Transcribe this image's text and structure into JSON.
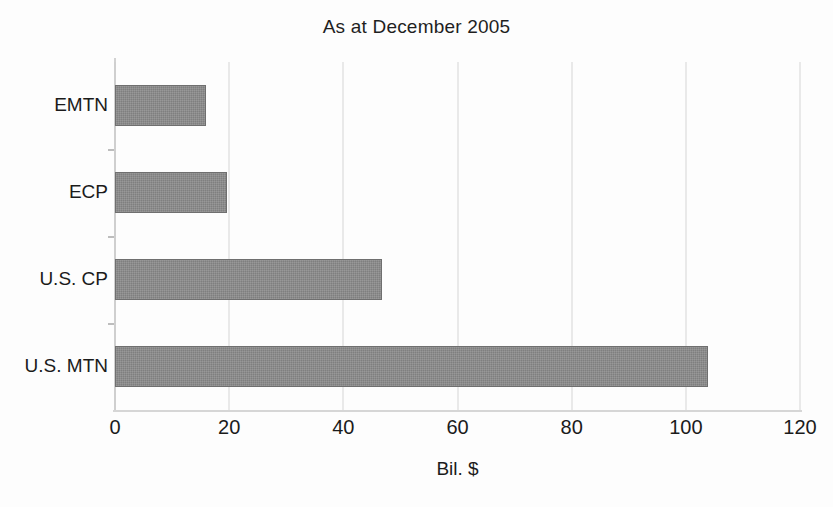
{
  "chart_data": {
    "type": "bar",
    "orientation": "horizontal",
    "title": "As at December 2005",
    "xlabel": "Bil. $",
    "ylabel": "",
    "categories": [
      "EMTN",
      "ECP",
      "U.S. CP",
      "U.S. MTN"
    ],
    "values": [
      16,
      19.7,
      46.8,
      103.8
    ],
    "xlim": [
      0,
      120
    ],
    "xticks": [
      0,
      20,
      40,
      60,
      80,
      100,
      120
    ],
    "xtick_labels": [
      "0",
      "20",
      "40",
      "60",
      "80",
      "100",
      "120"
    ],
    "grid": "vertical",
    "legend": null,
    "series": [
      {
        "name": "Outstanding",
        "values": [
          16,
          19.7,
          46.8,
          103.8
        ]
      }
    ],
    "colors": {
      "bar_fill": "#7f7f7f",
      "bar_edge": "#6f6f6f",
      "gridline": "#e9e9e9",
      "axis": "#d2d2d2",
      "text": "#1b1b1b",
      "background": "#fdfdfd"
    }
  }
}
